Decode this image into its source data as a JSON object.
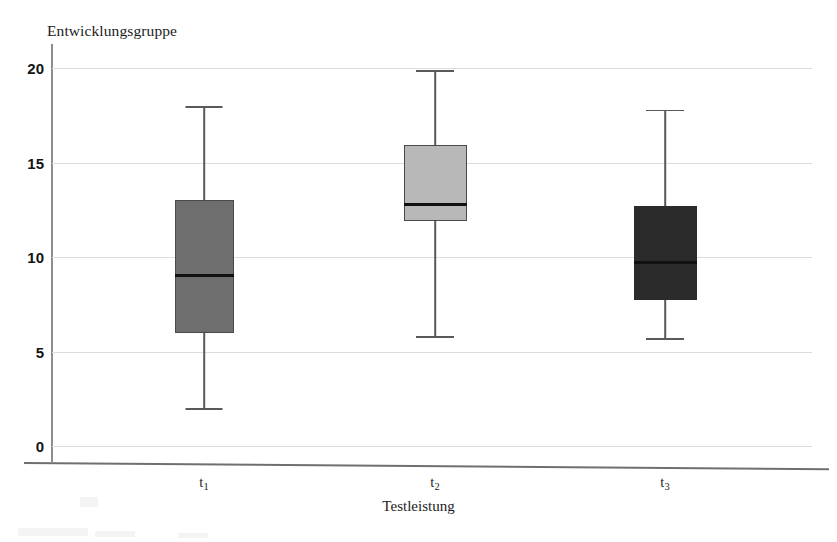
{
  "chart_data": {
    "type": "box",
    "title": "",
    "ylabel": "Entwicklungsgruppe",
    "xlabel": "Testleistung",
    "categories": [
      "t1",
      "t2",
      "t3"
    ],
    "category_labels_base": [
      "t",
      "t",
      "t"
    ],
    "category_labels_sub": [
      "1",
      "2",
      "3"
    ],
    "ylim": [
      0,
      20
    ],
    "yticks": [
      0,
      5,
      10,
      15,
      20
    ],
    "ytick_labels": [
      "0",
      "5",
      "10",
      "15",
      "20"
    ],
    "grid": true,
    "grid_axis": "y",
    "legend": "none",
    "boxes": [
      {
        "category": "t1",
        "whisker_low": 2.0,
        "q1": 6.0,
        "median": 9.0,
        "q3": 13.0,
        "whisker_high": 18.0,
        "fill": "#6e6e6e",
        "edge": "#4a4a4a"
      },
      {
        "category": "t2",
        "whisker_low": 5.8,
        "q1": 11.9,
        "median": 12.8,
        "q3": 15.9,
        "whisker_high": 19.9,
        "fill": "#b8b8b8",
        "edge": "#4a4a4a"
      },
      {
        "category": "t3",
        "whisker_low": 5.7,
        "q1": 7.7,
        "median": 9.7,
        "q3": 12.7,
        "whisker_high": 17.8,
        "fill": "#2b2b2b",
        "edge": "#2b2b2b"
      }
    ]
  },
  "colors": {
    "background": "#ffffff",
    "gridline": "#dcdcdc",
    "axis": "#6f6f6f",
    "text": "#1c1c1c",
    "median": "#111111"
  }
}
